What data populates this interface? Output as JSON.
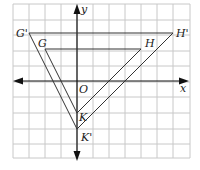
{
  "diagram": {
    "grid": {
      "x_lines": [
        13,
        29,
        45,
        61,
        77,
        93,
        109,
        125,
        141,
        157,
        173,
        190
      ],
      "y_lines": [
        4,
        20,
        35,
        51,
        66,
        82,
        97,
        113,
        129,
        144,
        158
      ],
      "color": "#c8c8c8"
    },
    "origin_px": [
      77,
      81
    ],
    "unit_px": 16,
    "axes": {
      "x_label": "x",
      "y_label": "y",
      "origin_label": "O",
      "color": "#111111"
    },
    "triangles": [
      {
        "name": "original",
        "vertices": [
          {
            "label": "G",
            "coord": [
              -2,
              2
            ]
          },
          {
            "label": "H",
            "coord": [
              4,
              2
            ]
          },
          {
            "label": "K",
            "coord": [
              0,
              -2
            ]
          }
        ]
      },
      {
        "name": "image",
        "vertices": [
          {
            "label": "G'",
            "coord": [
              -3,
              3
            ]
          },
          {
            "label": "H'",
            "coord": [
              6,
              3
            ]
          },
          {
            "label": "K'",
            "coord": [
              0,
              -3
            ]
          }
        ]
      }
    ],
    "line_color": "#333333"
  }
}
